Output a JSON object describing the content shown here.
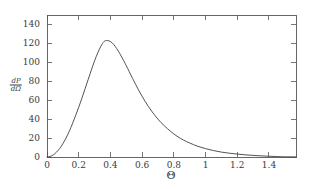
{
  "chart_data": {
    "type": "line",
    "title": "",
    "xlabel": "Θ",
    "ylabel": "dP/dΩ",
    "ylabel_numerator": "dP",
    "ylabel_denominator": "dΩ",
    "xlim": [
      0,
      1.5708
    ],
    "ylim": [
      0,
      150
    ],
    "grid": false,
    "legend": null,
    "xticks": [
      0,
      0.2,
      0.4,
      0.6,
      0.8,
      1,
      1.2,
      1.4
    ],
    "xtick_labels": [
      "0",
      "0.2",
      "0.4",
      "0.6",
      "0.8",
      "1",
      "1.2",
      "1.4"
    ],
    "yticks": [
      0,
      20,
      40,
      60,
      80,
      100,
      120,
      140
    ],
    "ytick_labels": [
      "0",
      "20",
      "40",
      "60",
      "80",
      "100",
      "120",
      "140"
    ],
    "peak": {
      "x": 0.36,
      "y": 123
    },
    "line_color": "#404040",
    "frame_color": "#555555",
    "background_color": "#ffffff",
    "series": [
      {
        "name": "dP/dOmega",
        "x": [
          0.0,
          0.02,
          0.04,
          0.06,
          0.08,
          0.1,
          0.12,
          0.14,
          0.16,
          0.18,
          0.2,
          0.22,
          0.24,
          0.26,
          0.28,
          0.3,
          0.32,
          0.34,
          0.36,
          0.38,
          0.4,
          0.42,
          0.44,
          0.46,
          0.48,
          0.5,
          0.54,
          0.58,
          0.62,
          0.66,
          0.7,
          0.74,
          0.78,
          0.82,
          0.86,
          0.9,
          0.95,
          1.0,
          1.05,
          1.1,
          1.15,
          1.2,
          1.25,
          1.3,
          1.35,
          1.4,
          1.45,
          1.5,
          1.5708
        ],
        "y": [
          0.0,
          0.6,
          2.3,
          5.1,
          9.0,
          14.0,
          20.0,
          27.0,
          35.0,
          43.5,
          52.5,
          62.0,
          72.0,
          82.0,
          92.0,
          101.5,
          110.0,
          117.0,
          122.0,
          123.0,
          122.0,
          119.0,
          114.5,
          109.0,
          103.0,
          96.5,
          83.0,
          70.0,
          58.5,
          48.5,
          40.0,
          33.0,
          27.0,
          22.0,
          18.0,
          14.8,
          11.4,
          8.8,
          6.8,
          5.2,
          4.0,
          3.1,
          2.3,
          1.7,
          1.2,
          0.8,
          0.5,
          0.25,
          0.1
        ]
      }
    ]
  },
  "axes": {
    "x_title": "Θ",
    "y_title_num": "dP",
    "y_title_den": "dΩ"
  }
}
